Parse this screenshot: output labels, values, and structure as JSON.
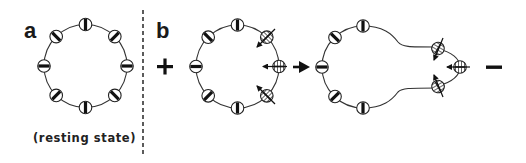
{
  "figure": {
    "panels": [
      {
        "id": "a",
        "label": "a",
        "caption": "(resting state)"
      },
      {
        "id": "b",
        "label": "b"
      }
    ],
    "signs": {
      "plus": "+",
      "minus": "—"
    },
    "colors": {
      "line": "#222222",
      "fill": "#ffffff",
      "ink": "#111111",
      "divider": "#333333"
    }
  }
}
